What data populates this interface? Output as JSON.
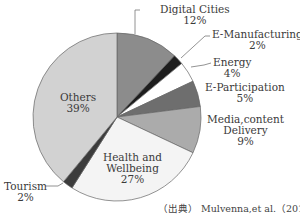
{
  "chart_data": {
    "type": "pie",
    "title": "",
    "start_angle": "12 o'clock, clockwise",
    "categories": [
      "Digital Cities",
      "E-Manufacturing",
      "Energy",
      "E-Participation",
      "Media,content Delivery",
      "Health and Wellbeing",
      "Tourism",
      "Others"
    ],
    "values": [
      12,
      2,
      4,
      5,
      9,
      27,
      2,
      39
    ],
    "unit": "%",
    "colors": [
      "#8c8c8c",
      "#1e1e1e",
      "#ffffff",
      "#6e6e6e",
      "#ababab",
      "#f4f4f4",
      "#3c3c3c",
      "#d2d2d2"
    ],
    "source": "（出典） Mulvenna,et al.（2011）"
  },
  "labels": {
    "digital": {
      "name": "Digital Cities",
      "pct": "12%"
    },
    "emanu": {
      "name": "E-Manufacturing",
      "pct": "2%"
    },
    "energy": {
      "name": "Energy",
      "pct": "4%"
    },
    "epart": {
      "name": "E-Participation",
      "pct": "5%"
    },
    "media1": "Media,content",
    "media2": "Delivery",
    "media_pct": "9%",
    "health1": "Health and",
    "health2": "Wellbeing",
    "health_pct": "27%",
    "tourism": {
      "name": "Tourism",
      "pct": "2%"
    },
    "others": {
      "name": "Others",
      "pct": "39%"
    }
  },
  "source": "（出典） Mulvenna,et al.（2011）"
}
